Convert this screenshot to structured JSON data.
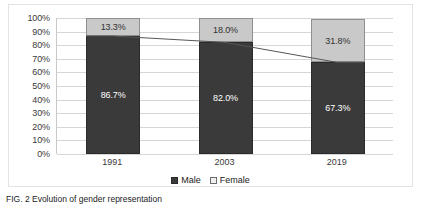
{
  "chart_data": {
    "type": "bar",
    "subtype": "stacked-100-percent-with-trend-line",
    "title": "",
    "xlabel": "",
    "ylabel": "",
    "categories": [
      "1991",
      "2003",
      "2019"
    ],
    "series": [
      {
        "name": "Male",
        "values": [
          86.7,
          82.0,
          67.3
        ],
        "labels": [
          "86.7%",
          "82.0%",
          "67.3%"
        ],
        "color": "#3a3a3a"
      },
      {
        "name": "Female",
        "values": [
          13.3,
          18.0,
          31.8
        ],
        "labels": [
          "13.3%",
          "18.0%",
          "31.8%"
        ],
        "color": "#c9c9c9"
      }
    ],
    "trend_line": {
      "name": "Male share trend",
      "values": [
        86.7,
        82.0,
        67.3
      ],
      "color": "#555555"
    },
    "ylim": [
      0,
      100
    ],
    "y_ticks": [
      "0%",
      "10%",
      "20%",
      "30%",
      "40%",
      "50%",
      "60%",
      "70%",
      "80%",
      "90%",
      "100%"
    ],
    "y_tick_values": [
      0,
      10,
      20,
      30,
      40,
      50,
      60,
      70,
      80,
      90,
      100
    ],
    "grid": true,
    "legend": {
      "position": "bottom",
      "entries": [
        {
          "label": "Male",
          "swatch": "filled-dark-square"
        },
        {
          "label": "Female",
          "swatch": "outlined-light-square"
        }
      ]
    }
  },
  "caption": {
    "text": "FIG. 2   Evolution of gender representation"
  },
  "colors": {
    "male": "#3a3a3a",
    "female": "#c9c9c9",
    "grid": "#d6d6d6",
    "frame": "#e3e3e3",
    "axis": "#c9c9c9",
    "text": "#3a3a3a"
  }
}
